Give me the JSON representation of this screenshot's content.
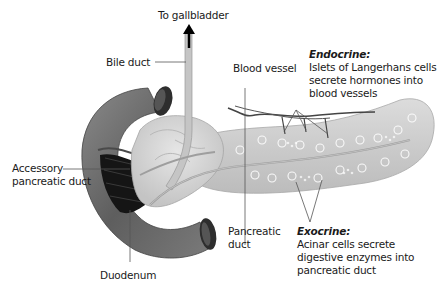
{
  "diagram": {
    "labels": {
      "to_gallbladder": "To gallbladder",
      "bile_duct": "Bile duct",
      "blood_vessel": "Blood vessel",
      "accessory_duct": [
        "Accessory",
        "pancreatic duct"
      ],
      "duodenum": "Duodenum",
      "pancreatic_duct": [
        "Pancreatic",
        "duct"
      ],
      "endocrine": {
        "heading": "Endocrine:",
        "lines": [
          "Islets of Langerhans cells",
          "secrete hormones into",
          "blood vessels"
        ]
      },
      "exocrine": {
        "heading": "Exocrine:",
        "lines": [
          "Acinar cells secrete",
          "digestive enzymes into",
          "pancreatic duct"
        ]
      }
    },
    "colors": {
      "duodenum": "#6e6e6e",
      "duodenum_dark": "#3a3a3a",
      "pancreas": "#cfcfcf",
      "pancreas_head": "#d8d8d8",
      "duct": "#b5b5b5",
      "vessel": "#4a4a4a",
      "leader_line": "#555555",
      "text": "#1a1a1a"
    }
  }
}
